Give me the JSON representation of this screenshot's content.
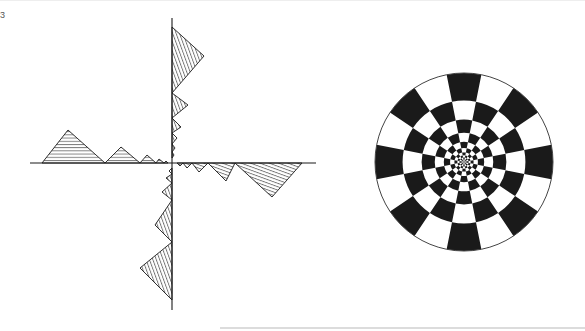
{
  "figure": {
    "edge_mark": "3",
    "colors": {
      "ink": "#1a1a1a",
      "paper": "#ffffff",
      "axis": "#333333"
    },
    "left_diagram": {
      "description": "Axes with hatched sawtooth triangles shrinking toward the origin along each half-axis",
      "origin": [
        172,
        163
      ],
      "x_axis": [
        30,
        316
      ],
      "y_axis": [
        18,
        310
      ],
      "hatch_spacing": 3.2,
      "triangles": [
        {
          "side": "left-up",
          "base": [
            42,
            105
          ],
          "apex": [
            68,
            130
          ]
        },
        {
          "side": "left-up",
          "base": [
            105,
            140
          ],
          "apex": [
            121,
            147
          ]
        },
        {
          "side": "left-up",
          "base": [
            140,
            156
          ],
          "apex": [
            147,
            155
          ]
        },
        {
          "side": "left-up",
          "base": [
            156,
            164
          ],
          "apex": [
            159,
            159
          ]
        },
        {
          "side": "left-up",
          "base": [
            164,
            168
          ],
          "apex": [
            166,
            161
          ]
        },
        {
          "side": "right-down",
          "base": [
            235,
            302
          ],
          "apex": [
            272,
            197
          ]
        },
        {
          "side": "right-down",
          "base": [
            208,
            235
          ],
          "apex": [
            226,
            181
          ]
        },
        {
          "side": "right-down",
          "base": [
            192,
            208
          ],
          "apex": [
            199,
            172
          ]
        },
        {
          "side": "right-down",
          "base": [
            183,
            192
          ],
          "apex": [
            187,
            168
          ]
        },
        {
          "side": "right-down",
          "base": [
            177,
            183
          ],
          "apex": [
            180,
            166
          ]
        },
        {
          "side": "top-right",
          "base": [
            27,
            93
          ],
          "apex": [
            204,
            56
          ]
        },
        {
          "side": "top-right",
          "base": [
            93,
            118
          ],
          "apex": [
            188,
            105
          ]
        },
        {
          "side": "top-right",
          "base": [
            118,
            133
          ],
          "apex": [
            181,
            127
          ]
        },
        {
          "side": "top-right",
          "base": [
            133,
            144
          ],
          "apex": [
            177,
            138
          ]
        },
        {
          "side": "top-right",
          "base": [
            144,
            152
          ],
          "apex": [
            175,
            148
          ]
        },
        {
          "side": "top-right",
          "base": [
            152,
            158
          ],
          "apex": [
            174,
            155
          ]
        },
        {
          "side": "bottom-left",
          "base": [
            242,
            300
          ],
          "apex": [
            140,
            268
          ]
        },
        {
          "side": "bottom-left",
          "base": [
            200,
            242
          ],
          "apex": [
            155,
            225
          ]
        },
        {
          "side": "bottom-left",
          "base": [
            183,
            200
          ],
          "apex": [
            162,
            192
          ]
        },
        {
          "side": "bottom-left",
          "base": [
            174,
            183
          ],
          "apex": [
            166,
            178
          ]
        },
        {
          "side": "bottom-left",
          "base": [
            168,
            174
          ],
          "apex": [
            169,
            171
          ]
        }
      ]
    },
    "right_diagram": {
      "description": "Polar checkerboard disc: 16 sectors, alternating black/white cells in geometrically shrinking rings",
      "center": [
        464,
        162
      ],
      "radius": 89,
      "sectors": 16,
      "ring_ratio": 0.69,
      "rings": 9
    }
  }
}
